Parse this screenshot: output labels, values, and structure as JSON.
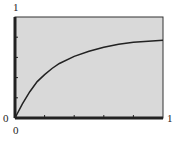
{
  "chart_data": {
    "type": "line",
    "title": "",
    "xlabel": "",
    "ylabel": "",
    "xlim": [
      0,
      1
    ],
    "ylim": [
      0,
      1
    ],
    "x_tick_labels": [
      "0",
      "1"
    ],
    "y_tick_labels": [
      "0",
      "1"
    ],
    "x_ticks": [
      0.2,
      0.4,
      0.6,
      0.8
    ],
    "y_ticks": [
      0.2,
      0.4,
      0.6,
      0.8
    ],
    "grid": false,
    "background": "#d9d9d9",
    "series": [
      {
        "name": "curve",
        "x": [
          0,
          0.05,
          0.1,
          0.15,
          0.2,
          0.25,
          0.3,
          0.4,
          0.5,
          0.6,
          0.7,
          0.8,
          0.9,
          1.0
        ],
        "values": [
          0,
          0.14,
          0.26,
          0.36,
          0.43,
          0.49,
          0.54,
          0.61,
          0.66,
          0.7,
          0.73,
          0.75,
          0.76,
          0.77
        ]
      }
    ]
  },
  "labels": {
    "y_max": "1",
    "y_min": "0",
    "x_min": "0",
    "x_max": "1"
  }
}
